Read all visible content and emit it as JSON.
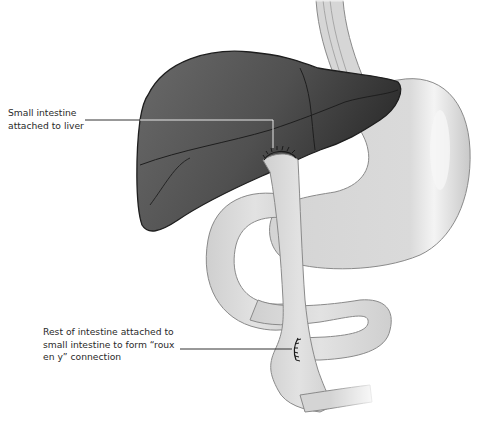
{
  "diagram": {
    "type": "anatomical illustration",
    "colors": {
      "background": "#ffffff",
      "liver_fill": "#555555",
      "liver_dark": "#2e2e2e",
      "organ_outline": "#1e1e1e",
      "intestine_fill": "#dcdcdc",
      "intestine_outline": "#8a8a8a",
      "stomach_fill": "#d8d8d8",
      "leader_line": "#333333",
      "leader_line_on_liver": "#e8e8e8",
      "text": "#2a2a2a"
    },
    "structures": [
      "esophagus",
      "liver",
      "stomach",
      "small intestine loop",
      "anastomosis sutures"
    ],
    "labels": [
      {
        "id": "liver-anastomosis",
        "text": "Small intestine\nattached to liver",
        "points_to": "suture site at liver underside"
      },
      {
        "id": "roux-y-anastomosis",
        "text": "Rest of intestine attached to\nsmall intestine to form “roux\nen y” connection",
        "points_to": "suture site on lower intestine"
      }
    ]
  }
}
